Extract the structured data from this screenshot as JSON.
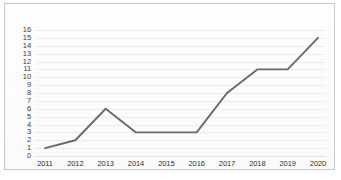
{
  "chart_data": {
    "type": "line",
    "title": "",
    "subtitle": "",
    "xlabel": "",
    "ylabel": "",
    "categories": [
      "2011",
      "2012",
      "2013",
      "2014",
      "2015",
      "2016",
      "2017",
      "2018",
      "2019",
      "2020"
    ],
    "values": [
      1,
      2,
      6,
      3,
      3,
      3,
      8,
      11,
      11,
      15
    ],
    "series": [
      {
        "name": "",
        "values": [
          1,
          2,
          6,
          3,
          3,
          3,
          8,
          11,
          11,
          15
        ]
      }
    ],
    "ylim": [
      0,
      16
    ],
    "ytick_step": 1,
    "yticks": [
      0,
      1,
      2,
      3,
      4,
      5,
      6,
      7,
      8,
      9,
      10,
      11,
      12,
      13,
      14,
      15,
      16
    ],
    "xticks": [
      "2011",
      "2012",
      "2013",
      "2014",
      "2015",
      "2016",
      "2017",
      "2018",
      "2019",
      "2020"
    ],
    "grid": true,
    "grid_axis": "y",
    "legend": false,
    "legend_position": "none",
    "markers": false,
    "annotations": [],
    "colors": {
      "line": "#6a6a6a",
      "grid": "#ececec",
      "frame": "#c9c9c9",
      "tick_label": "#2f2f2f",
      "background": "#ffffff"
    }
  }
}
